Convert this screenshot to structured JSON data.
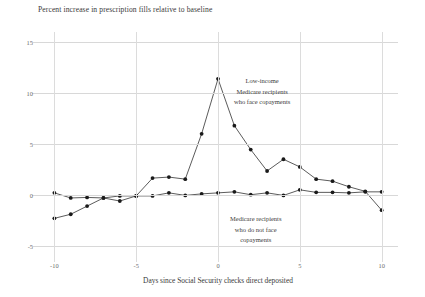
{
  "chart_data": {
    "type": "line",
    "title": "Percent increase in prescription fills relative to baseline",
    "xlabel": "Days since Social Security checks direct deposited",
    "ylabel": "",
    "xlim": [
      -11,
      11
    ],
    "ylim": [
      -6,
      16
    ],
    "xticks": [
      -10,
      -5,
      0,
      5,
      10
    ],
    "xtick_labels": [
      "-10",
      "-5",
      "0",
      "5",
      "10"
    ],
    "yticks": [
      -5,
      0,
      5,
      10,
      15
    ],
    "ytick_labels": [
      "-5",
      "0",
      "5",
      "10",
      "15"
    ],
    "grid": true,
    "legend_position": "annotations-inline",
    "x": [
      -10,
      -9,
      -8,
      -7,
      -6,
      -5,
      -4,
      -3,
      -2,
      -1,
      0,
      1,
      2,
      3,
      4,
      5,
      6,
      7,
      8,
      9,
      10
    ],
    "series": [
      {
        "name": "Low-income Medicare recipients who face copayments",
        "values": [
          -2.3,
          -1.9,
          -1.1,
          -0.3,
          -0.6,
          -0.1,
          1.65,
          1.75,
          1.55,
          6.0,
          11.4,
          6.8,
          4.45,
          2.35,
          3.5,
          2.75,
          1.55,
          1.35,
          0.8,
          0.35,
          -1.5
        ]
      },
      {
        "name": "Medicare recipients who do not face copayments",
        "values": [
          0.2,
          -0.3,
          -0.25,
          -0.3,
          -0.1,
          -0.1,
          -0.1,
          0.2,
          -0.05,
          0.1,
          0.2,
          0.3,
          0.02,
          0.2,
          -0.05,
          0.5,
          0.25,
          0.25,
          0.2,
          0.3,
          0.3
        ]
      }
    ],
    "annotations": [
      {
        "id": "copay",
        "lines": [
          "Low-income",
          "Medicare recipients",
          "who face copayments"
        ]
      },
      {
        "id": "nocopay",
        "lines": [
          "Medicare recipients",
          "who do not face",
          "copayments"
        ]
      }
    ]
  }
}
